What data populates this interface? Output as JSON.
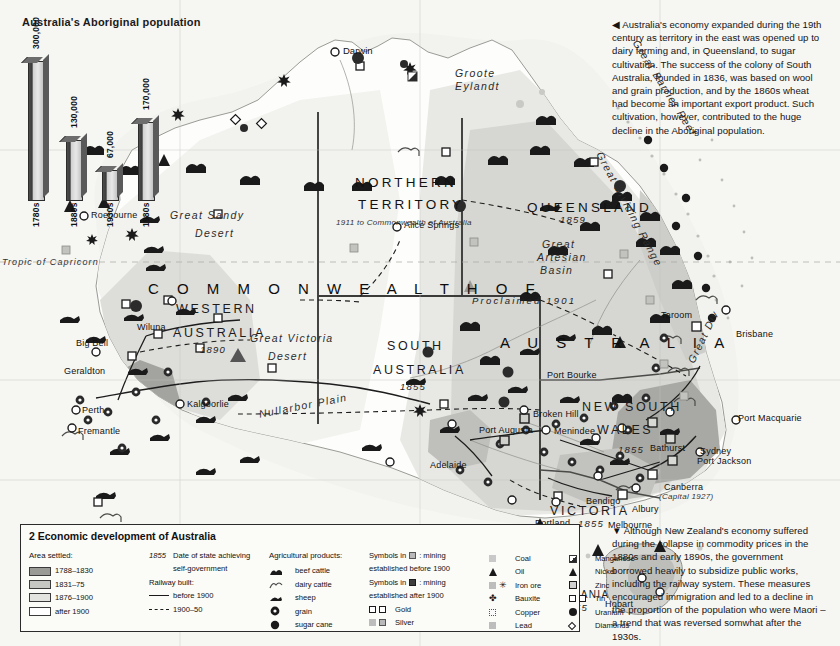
{
  "figure": {
    "chart_title": "Australia's Aboriginal population",
    "legend_title": "2 Economic development of Australia"
  },
  "chart_data": {
    "type": "bar",
    "title": "Australia's Aboriginal population",
    "categories": [
      "1780s",
      "1880s",
      "1930s",
      "1980s"
    ],
    "values": [
      300000,
      130000,
      67000,
      170000
    ],
    "value_labels": [
      "300,000",
      "130,000",
      "67,000",
      "170,000"
    ],
    "xlabel": "",
    "ylabel": "",
    "ylim": [
      0,
      300000
    ],
    "grid": false,
    "legend": "none"
  },
  "side_text": {
    "top": "◀ Australia's economy expanded during the 19th century as territory in the east was opened up to dairy farming and, in Queensland, to sugar cultivation. The success of the colony of South Australia, founded in 1836, was based on wool and grain production, and by the 1860s wheat had become an important export product. Such cultivation, however, contributed to the huge decline in the Aboriginal population.",
    "bottom": "▼ Although New Zealand's economy suffered during the collapse in commodity prices in the 1880s and early 1890s, the government borrowed heavily to subsidize public works, including the railway system. These measures encouraged immigration and led to a decline in the proportion of the population who were Maori – a trend that was reversed somwhat after the 1930s."
  },
  "legend": {
    "title": "2 Economic development of Australia",
    "area_settled": {
      "header": "Area settled:",
      "items": [
        {
          "label": "1788–1830",
          "color": "#9a9a96"
        },
        {
          "label": "1831–75",
          "color": "#c6c6c2"
        },
        {
          "label": "1876–1900",
          "color": "#e3e3e0"
        },
        {
          "label": "after 1900",
          "color": "#ffffff"
        }
      ]
    },
    "state_date": {
      "marker": "1855",
      "line1": "Date of state achieving",
      "line2": "self-government"
    },
    "railway": {
      "header": "Railway built:",
      "items": [
        {
          "label": "before 1900",
          "style": "solid"
        },
        {
          "label": "1900–50",
          "style": "dashed"
        }
      ]
    },
    "agricultural": {
      "header": "Agricultural products:",
      "items": [
        {
          "label": "beef cattle",
          "icon": "beef-cattle-icon"
        },
        {
          "label": "dairy cattle",
          "icon": "dairy-cattle-icon"
        },
        {
          "label": "sheep",
          "icon": "sheep-icon"
        },
        {
          "label": "grain",
          "icon": "grain-icon"
        },
        {
          "label": "sugar cane",
          "icon": "sugar-cane-icon"
        }
      ]
    },
    "mining_note": {
      "line1": "Symbols in",
      "line1b": ": mining",
      "line2": "established before 1900",
      "line3": "Symbols in",
      "line3b": ": mining",
      "line4": "established after 1900"
    },
    "precious": [
      {
        "label": "Gold",
        "icon": "gold-icon"
      },
      {
        "label": "Silver",
        "icon": "silver-icon"
      }
    ],
    "minerals_col1": [
      {
        "label": "Coal",
        "icon": "coal-icon"
      },
      {
        "label": "Oil",
        "icon": "oil-icon"
      },
      {
        "label": "Iron ore",
        "icon": "iron-ore-icon"
      },
      {
        "label": "Bauxite",
        "icon": "bauxite-icon"
      },
      {
        "label": "Copper",
        "icon": "copper-icon"
      },
      {
        "label": "Lead",
        "icon": "lead-icon"
      }
    ],
    "minerals_col2": [
      {
        "label": "Manganese",
        "icon": "manganese-icon"
      },
      {
        "label": "Nickel",
        "icon": "nickel-icon"
      },
      {
        "label": "Zinc",
        "icon": "zinc-icon"
      },
      {
        "label": "Tin",
        "icon": "tin-icon"
      },
      {
        "label": "Uranium",
        "icon": "uranium-icon"
      },
      {
        "label": "Diamonds",
        "icon": "diamonds-icon"
      }
    ]
  },
  "map": {
    "country": "COMMONWEALTH OF AUSTRALIA",
    "country_part1": "C O M M O N W E A L T H   O F",
    "country_part2": "A U S T R A L I A",
    "proclaimed": "Proclaimed 1901",
    "states": [
      {
        "name": "NORTHERN",
        "name2": "TERRITORY",
        "note": "1911 to Commonwealth of Australia"
      },
      {
        "name": "QUEENSLAND",
        "date": "1859"
      },
      {
        "name": "WESTERN",
        "name2": "AUSTRALIA",
        "date": "1890"
      },
      {
        "name": "SOUTH",
        "name2": "AUSTRALIA",
        "date": "1855"
      },
      {
        "name": "NEW SOUTH",
        "name2": "WALES",
        "date": "1855"
      },
      {
        "name": "VICTORIA",
        "date": "1855"
      },
      {
        "name": "TASMANIA",
        "date": "1855"
      }
    ],
    "geography": [
      "Great Sandy Desert",
      "Great Victoria Desert",
      "Great Artesian Basin",
      "Great Dividing Range",
      "Great Barrier Reef",
      "Nullarbor Plain",
      "Tropic of Capricorn",
      "Groote Eylandt"
    ],
    "cities": [
      "Darwin",
      "Alice Springs",
      "Roebourne",
      "Wiluna",
      "Big Bell",
      "Geraldton",
      "Perth",
      "Fremantle",
      "Kalgoorlie",
      "Port Augusta",
      "Adelaide",
      "Broken Hill",
      "Menindee",
      "Bathurst",
      "Taroom",
      "Brisbane",
      "Port Macquarie",
      "Sydney",
      "Port Jackson",
      "Canberra",
      "Albury",
      "Bendigo",
      "Melbourne",
      "Portland",
      "Hobart",
      "Port Bourke"
    ],
    "canberra_note": "(Capital 1927)"
  }
}
